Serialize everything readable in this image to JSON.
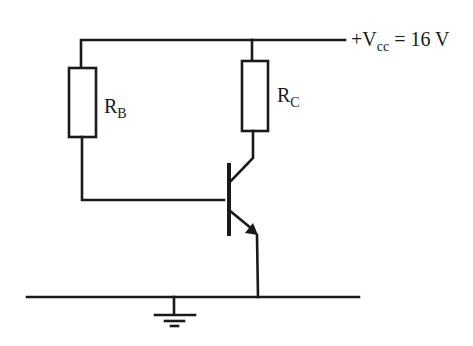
{
  "diagram": {
    "type": "circuit-schematic",
    "supply": {
      "prefix": "+V",
      "subscript": "cc",
      "suffix": " = 16 V"
    },
    "components": [
      {
        "id": "RB",
        "label_main": "R",
        "label_sub": "B",
        "kind": "resistor"
      },
      {
        "id": "RC",
        "label_main": "R",
        "label_sub": "C",
        "kind": "resistor"
      },
      {
        "id": "Q",
        "kind": "npn-transistor"
      },
      {
        "id": "GND",
        "kind": "ground"
      }
    ],
    "colors": {
      "line": "#1a1a1a",
      "background": "#ffffff"
    }
  }
}
